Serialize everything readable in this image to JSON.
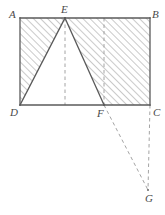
{
  "figure": {
    "type": "geometry-diagram",
    "colors": {
      "outline": "#5a5a5a",
      "hatch": "#8a8a8a",
      "dashed": "#9a9a9a",
      "label": "#4a4a4a",
      "background": "#ffffff"
    },
    "points": [
      {
        "name": "A",
        "x": 20,
        "y": 18,
        "label_x": 9,
        "label_y": 9
      },
      {
        "name": "B",
        "x": 150,
        "y": 18,
        "label_x": 152,
        "label_y": 9
      },
      {
        "name": "C",
        "x": 150,
        "y": 105,
        "label_x": 153,
        "label_y": 107
      },
      {
        "name": "D",
        "x": 20,
        "y": 105,
        "label_x": 10,
        "label_y": 107
      },
      {
        "name": "E",
        "x": 65,
        "y": 18,
        "label_x": 61,
        "label_y": 4
      },
      {
        "name": "F",
        "x": 104,
        "y": 105,
        "label_x": 97,
        "label_y": 108
      },
      {
        "name": "G",
        "x": 148,
        "y": 190,
        "label_x": 145,
        "label_y": 193
      }
    ],
    "solid_segments": [
      {
        "name": "side-AB",
        "from": "A",
        "to": "B"
      },
      {
        "name": "side-BC",
        "from": "B",
        "to": "C"
      },
      {
        "name": "side-CD",
        "from": "C",
        "to": "D"
      },
      {
        "name": "side-DA",
        "from": "D",
        "to": "A"
      },
      {
        "name": "segment-DE",
        "from": "D",
        "to": "E"
      },
      {
        "name": "segment-EF",
        "from": "E",
        "to": "F"
      }
    ],
    "dashed_segments": [
      {
        "name": "altitude-from-E",
        "x1": 65,
        "y1": 18,
        "x2": 65,
        "y2": 105
      },
      {
        "name": "vertical-through-F",
        "x1": 104,
        "y1": 18,
        "x2": 104,
        "y2": 105
      },
      {
        "name": "segment-FG",
        "x1": 104,
        "y1": 105,
        "x2": 148,
        "y2": 190
      },
      {
        "name": "segment-CG",
        "x1": 150,
        "y1": 105,
        "x2": 148,
        "y2": 190
      }
    ],
    "hatched_region": {
      "name": "shaded-area",
      "path": "M20,18 L150,18 L150,105 L104,105 L65,18 L20,105 Z",
      "angle_degrees": 45
    },
    "white_region": {
      "name": "triangle-DEF",
      "path": "M20,105 L65,18 L104,105 Z"
    }
  }
}
